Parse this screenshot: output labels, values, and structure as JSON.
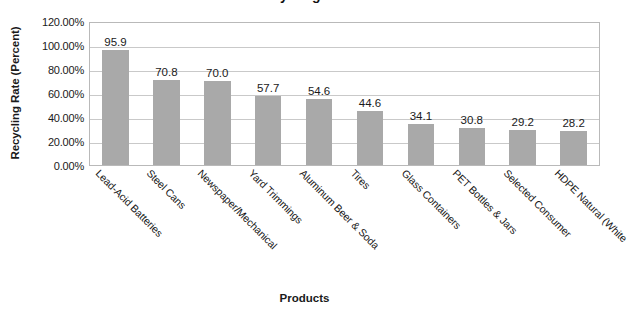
{
  "chart_data": {
    "type": "bar",
    "title": "Recycling Rate",
    "xlabel": "Products",
    "ylabel": "Recycling Rate (Percent)",
    "categories": [
      "Lead-Acid Batteries",
      "Steel Cans",
      "Newspaper/Mechanical",
      "Yard Trimmings",
      "Aluminum Beer & Soda",
      "Tires",
      "Glass Containers",
      "PET Bottles & Jars",
      "Selected Consumer",
      "HDPE Natural (White"
    ],
    "values": [
      95.9,
      70.8,
      70.0,
      57.7,
      54.6,
      44.6,
      34.1,
      30.8,
      29.2,
      28.2
    ],
    "data_labels": [
      "95.9",
      "70.8",
      "70.0",
      "57.7",
      "54.6",
      "44.6",
      "34.1",
      "30.8",
      "29.2",
      "28.2"
    ],
    "ylim": [
      0,
      120
    ],
    "ytick_values": [
      0,
      20,
      40,
      60,
      80,
      100,
      120
    ],
    "ytick_labels": [
      "0.00%",
      "20.00%",
      "40.00%",
      "60.00%",
      "80.00%",
      "100.00%",
      "120.00%"
    ],
    "grid": true,
    "legend": "none",
    "bar_color": "#a9a9a9",
    "gridline_color": "#c9c9c9",
    "plot_border_color": "#b9b9b9",
    "background_color": "#ffffff"
  }
}
